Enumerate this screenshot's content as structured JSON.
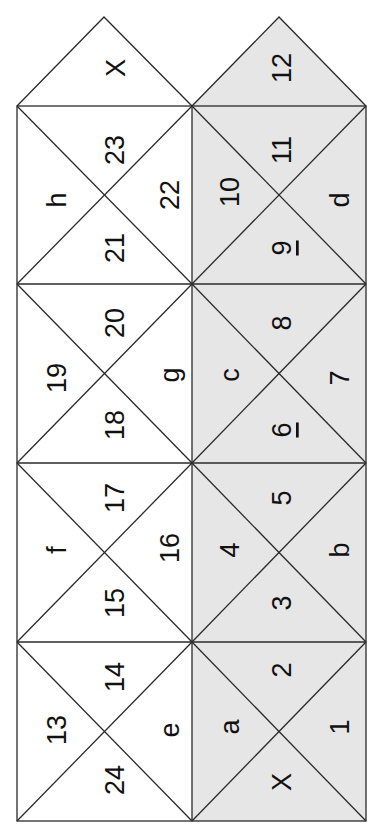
{
  "diagram": {
    "title": "",
    "colors": {
      "left_fill": "#ffffff",
      "right_fill": "#e6e6e6",
      "stroke": "#2a2a2a",
      "text": "#111111"
    },
    "left_column": {
      "top_triangle": "X",
      "cells": [
        {
          "top": "23",
          "left": "h",
          "right": "22",
          "bottom": "21"
        },
        {
          "top": "20",
          "left": "19",
          "right": "g",
          "bottom": "18"
        },
        {
          "top": "17",
          "left": "f",
          "right": "16",
          "bottom": "15"
        },
        {
          "top": "14",
          "left": "13",
          "right": "e",
          "bottom": "24"
        }
      ]
    },
    "right_column": {
      "top_triangle": "12",
      "cells": [
        {
          "top": "11",
          "left": "10",
          "right": "d",
          "bottom": "9"
        },
        {
          "top": "8",
          "left": "c",
          "right": "7",
          "bottom": "6"
        },
        {
          "top": "5",
          "left": "4",
          "right": "b",
          "bottom": "3"
        },
        {
          "top": "2",
          "left": "a",
          "right": "1",
          "bottom": "X"
        }
      ]
    },
    "underlined_labels": [
      "9",
      "6"
    ],
    "text_orientation": "rotated 90° counterclockwise"
  }
}
